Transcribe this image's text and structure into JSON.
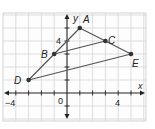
{
  "diagram": {
    "type": "coordinate-plane",
    "grid": {
      "xmin": -5,
      "xmax": 6,
      "ymin": -2,
      "ymax": 6,
      "step": 1
    },
    "axes": {
      "x_label": "x",
      "y_label": "y",
      "x_ticks_labeled": [
        {
          "value": -4,
          "label": "−4"
        },
        {
          "value": 0,
          "label": "0"
        },
        {
          "value": 4,
          "label": "4"
        }
      ],
      "y_ticks_labeled": [
        {
          "value": 4,
          "label": "4"
        }
      ]
    },
    "points": [
      {
        "name": "A",
        "x": 1,
        "y": 5
      },
      {
        "name": "B",
        "x": -1,
        "y": 3
      },
      {
        "name": "C",
        "x": 3,
        "y": 4
      },
      {
        "name": "D",
        "x": -3,
        "y": 1
      },
      {
        "name": "E",
        "x": 5,
        "y": 3
      }
    ],
    "segments": [
      [
        "D",
        "A"
      ],
      [
        "A",
        "E"
      ],
      [
        "B",
        "C"
      ],
      [
        "D",
        "E"
      ]
    ],
    "labels": {
      "A": "A",
      "B": "B",
      "C": "C",
      "D": "D",
      "E": "E",
      "x_axis": "x",
      "y_axis": "y",
      "tick_neg4": "−4",
      "tick_0": "0",
      "tick_x4": "4",
      "tick_y4": "4"
    },
    "colors": {
      "grid": "#d4d4d4",
      "axis": "#222222",
      "segment": "#555555",
      "point": "#333333",
      "border": "#c8c8c8"
    }
  }
}
